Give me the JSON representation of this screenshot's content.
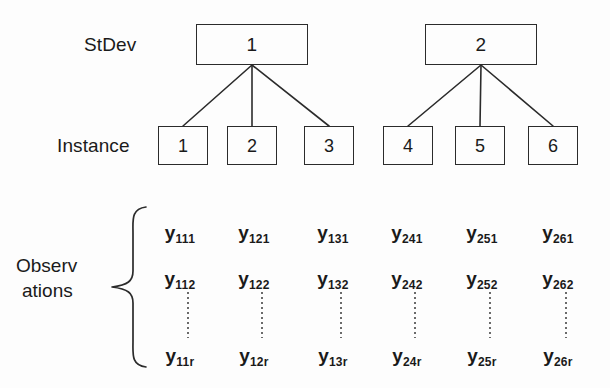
{
  "diagram": {
    "background_color": "#fdfdfd",
    "line_color": "#2b2b2b",
    "text_color": "#1a1a1a"
  },
  "rows": {
    "stdev_label": "StDev",
    "instance_label": "Instance",
    "observations_label_line1": "Observ",
    "observations_label_line2": "ations"
  },
  "stdev_nodes": [
    {
      "label": "1",
      "x": 196,
      "y": 24
    },
    {
      "label": "2",
      "x": 425,
      "y": 24
    }
  ],
  "instance_nodes": [
    {
      "label": "1",
      "x": 158,
      "y": 126,
      "parent": 0
    },
    {
      "label": "2",
      "x": 227,
      "y": 126,
      "parent": 0
    },
    {
      "label": "3",
      "x": 304,
      "y": 126,
      "parent": 0
    },
    {
      "label": "4",
      "x": 383,
      "y": 126,
      "parent": 1
    },
    {
      "label": "5",
      "x": 455,
      "y": 126,
      "parent": 1
    },
    {
      "label": "6",
      "x": 528,
      "y": 126,
      "parent": 1
    }
  ],
  "observation_columns": [
    {
      "cx": 180,
      "cells": [
        {
          "var": "y",
          "sub": "111"
        },
        {
          "var": "y",
          "sub": "112"
        },
        {
          "var": "y",
          "sub": "11r"
        }
      ]
    },
    {
      "cx": 254,
      "cells": [
        {
          "var": "y",
          "sub": "121"
        },
        {
          "var": "y",
          "sub": "122"
        },
        {
          "var": "y",
          "sub": "12r"
        }
      ]
    },
    {
      "cx": 333,
      "cells": [
        {
          "var": "y",
          "sub": "131"
        },
        {
          "var": "y",
          "sub": "132"
        },
        {
          "var": "y",
          "sub": "13r"
        }
      ]
    },
    {
      "cx": 407,
      "cells": [
        {
          "var": "y",
          "sub": "241"
        },
        {
          "var": "y",
          "sub": "242"
        },
        {
          "var": "y",
          "sub": "24r"
        }
      ]
    },
    {
      "cx": 482,
      "cells": [
        {
          "var": "y",
          "sub": "251"
        },
        {
          "var": "y",
          "sub": "252"
        },
        {
          "var": "y",
          "sub": "25r"
        }
      ]
    },
    {
      "cx": 558,
      "cells": [
        {
          "var": "y",
          "sub": "261"
        },
        {
          "var": "y",
          "sub": "262"
        },
        {
          "var": "y",
          "sub": "26r"
        }
      ]
    }
  ],
  "observation_row_y": [
    222,
    268,
    345
  ]
}
